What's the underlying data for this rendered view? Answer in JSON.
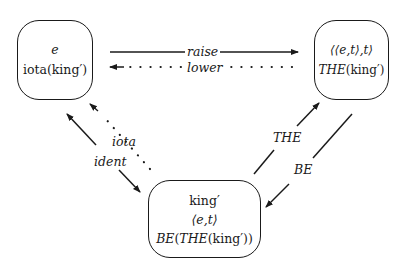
{
  "nodes": {
    "left": {
      "lines": [
        "e",
        "iota(king′)"
      ]
    },
    "right": {
      "line1": "⟨⟨e,t⟩,t⟩",
      "line2_italic": "THE",
      "line2_rest": "(king′)"
    },
    "bottom": {
      "line1": "king′",
      "line2": "⟨e,t⟩",
      "line3_be": "BE",
      "line3_paren": "(",
      "line3_the": "THE",
      "line3_rest": "(king′))"
    }
  },
  "edges": {
    "raise": "raise",
    "lower": "lower",
    "iota": "iota",
    "ident": "ident",
    "the": "THE",
    "be": "BE"
  },
  "colors": {
    "ink": "#1a1a1a",
    "background": "#ffffff"
  }
}
